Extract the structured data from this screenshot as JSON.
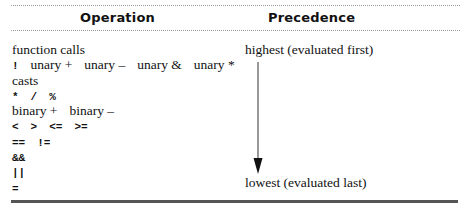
{
  "table": {
    "headers": {
      "operation": "Operation",
      "precedence": "Precedence"
    },
    "rows": [
      {
        "kind": "text",
        "tokens": [
          "function calls"
        ]
      },
      {
        "kind": "mixed",
        "tokens": [
          "!",
          "unary +",
          "unary –",
          "unary &",
          "unary *"
        ]
      },
      {
        "kind": "text",
        "tokens": [
          "casts"
        ]
      },
      {
        "kind": "sym",
        "tokens": [
          "*",
          "/",
          "%"
        ]
      },
      {
        "kind": "text",
        "tokens": [
          "binary +",
          "binary –"
        ]
      },
      {
        "kind": "sym",
        "tokens": [
          "<",
          ">",
          "<=",
          ">="
        ]
      },
      {
        "kind": "sym",
        "tokens": [
          "==",
          "!="
        ]
      },
      {
        "kind": "sym",
        "tokens": [
          "&&"
        ]
      },
      {
        "kind": "sym",
        "tokens": [
          "||"
        ]
      },
      {
        "kind": "sym",
        "tokens": [
          "="
        ]
      }
    ],
    "precedence": {
      "highest": "highest (evaluated first)",
      "lowest": "lowest (evaluated last)",
      "arrow_icon": "down-arrow"
    }
  }
}
